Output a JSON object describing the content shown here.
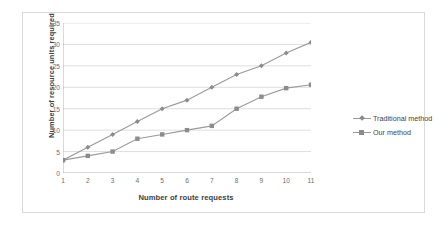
{
  "chart_data": {
    "type": "line",
    "title": "",
    "xlabel": "Number of route requests",
    "ylabel": "Number of resource units required",
    "x": [
      1,
      2,
      3,
      4,
      5,
      6,
      7,
      8,
      9,
      10,
      11
    ],
    "xtick_labels": [
      "1",
      "2",
      "3",
      "4",
      "5",
      "6",
      "7",
      "8",
      "9",
      "10",
      "11"
    ],
    "ytick_labels": [
      "0",
      "5",
      "10",
      "15",
      "20",
      "25",
      "30",
      "35"
    ],
    "yticks": [
      0,
      5,
      10,
      15,
      20,
      25,
      30,
      35
    ],
    "xlim": [
      1,
      11
    ],
    "ylim": [
      0,
      35
    ],
    "grid": "horizontal",
    "legend_position": "right",
    "series": [
      {
        "name": "Traditional method",
        "marker": "diamond",
        "color": "#8c8c8c",
        "values": [
          3,
          6,
          9,
          12,
          15,
          17,
          20,
          23,
          25,
          28,
          30.5
        ]
      },
      {
        "name": "Our method",
        "marker": "square",
        "color": "#8c8c8c",
        "values": [
          3,
          4,
          5,
          8,
          9,
          10,
          11,
          15,
          17.8,
          19.8,
          20.6
        ]
      }
    ]
  },
  "legend": {
    "items": [
      {
        "label": "Traditional method",
        "marker": "diamond"
      },
      {
        "label": "Our method",
        "marker": "square"
      }
    ]
  },
  "colors": {
    "line": "#9a9a9a",
    "marker": "#8c8c8c",
    "grid": "#d6d6d6",
    "axis": "#b3b3b3",
    "tick_text": "#6e6e6e",
    "title_text": "#404040",
    "frame": "#d9d9d9"
  }
}
